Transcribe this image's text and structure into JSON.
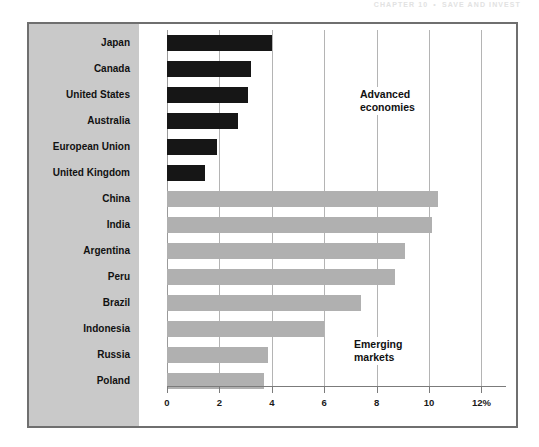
{
  "page": {
    "running_header_left": "CHAPTER 10",
    "running_header_sep": "•",
    "running_header_right": "SAVE AND INVEST"
  },
  "chart_data": {
    "type": "bar",
    "orientation": "horizontal",
    "title": "",
    "subtitle": "",
    "xlabel": "",
    "ylabel": "",
    "xlim": [
      0,
      12
    ],
    "grid": true,
    "legend_position": "inline-annotation",
    "xticks": [
      0,
      2,
      4,
      6,
      8,
      10,
      12
    ],
    "xtick_labels": [
      "0",
      "2",
      "4",
      "6",
      "8",
      "10",
      "12%"
    ],
    "categories": [
      "Japan",
      "Canada",
      "United States",
      "Australia",
      "European Union",
      "United Kingdom",
      "China",
      "India",
      "Argentina",
      "Peru",
      "Brazil",
      "Indonesia",
      "Russia",
      "Poland"
    ],
    "values": [
      4.0,
      3.2,
      3.1,
      2.7,
      1.9,
      1.45,
      10.35,
      10.1,
      9.1,
      8.7,
      7.4,
      6.0,
      3.85,
      3.7
    ],
    "groups": [
      {
        "name": "Advanced economies",
        "label": "Advanced\neconomies",
        "label_line1": "Advanced",
        "label_line2": "economies",
        "color": "#161616",
        "categories": [
          "Japan",
          "Canada",
          "United States",
          "Australia",
          "European Union",
          "United Kingdom"
        ],
        "values": [
          4.0,
          3.2,
          3.1,
          2.7,
          1.9,
          1.45
        ]
      },
      {
        "name": "Emerging markets",
        "label": "Emerging\nmarkets",
        "label_line1": "Emerging",
        "label_line2": "markets",
        "color": "#b0b0b0",
        "categories": [
          "China",
          "India",
          "Argentina",
          "Peru",
          "Brazil",
          "Indonesia",
          "Russia",
          "Poland"
        ],
        "values": [
          10.35,
          10.1,
          9.1,
          8.7,
          7.4,
          6.0,
          3.85,
          3.7
        ]
      }
    ],
    "series": [
      {
        "name": "Advanced economies",
        "color": "#161616",
        "values": [
          4.0,
          3.2,
          3.1,
          2.7,
          1.9,
          1.45,
          null,
          null,
          null,
          null,
          null,
          null,
          null,
          null
        ]
      },
      {
        "name": "Emerging markets",
        "color": "#b0b0b0",
        "values": [
          null,
          null,
          null,
          null,
          null,
          null,
          10.35,
          10.1,
          9.1,
          8.7,
          7.4,
          6.0,
          3.85,
          3.7
        ]
      }
    ],
    "colors": {
      "advanced": "#161616",
      "emerging": "#b0b0b0",
      "panel": "#c9c9c9",
      "frame": "#6f6f6f",
      "gridline": "#b4b4b4"
    }
  }
}
